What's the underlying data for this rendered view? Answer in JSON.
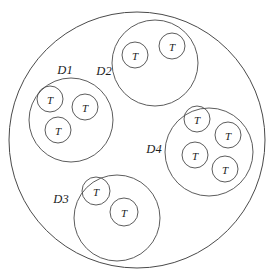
{
  "diagram": {
    "type": "nested-set-venn-diagram",
    "title": "",
    "background_color": "#ffffff",
    "stroke_color": "#4a4a4a",
    "text_color": "#1c1c1c",
    "canvas": {
      "width": 274,
      "height": 279
    },
    "universe": {
      "name": "outer-universe-circle",
      "label": "",
      "cx": 137,
      "cy": 140,
      "r": 128
    },
    "regions": [
      {
        "id": "D1",
        "label": "D1",
        "cx": 71,
        "cy": 120,
        "r": 42,
        "label_x": 65,
        "label_y": 70,
        "tuple_count": 3,
        "tuples": [
          {
            "label": "T",
            "cx": 50,
            "cy": 99,
            "r": 13
          },
          {
            "label": "T",
            "cx": 85,
            "cy": 107,
            "r": 13
          },
          {
            "label": "T",
            "cx": 58,
            "cy": 130,
            "r": 13
          }
        ]
      },
      {
        "id": "D2",
        "label": "D2",
        "cx": 155,
        "cy": 63,
        "r": 43,
        "label_x": 104,
        "label_y": 71,
        "tuple_count": 2,
        "tuples": [
          {
            "label": "T",
            "cx": 135,
            "cy": 55,
            "r": 13
          },
          {
            "label": "T",
            "cx": 172,
            "cy": 46,
            "r": 13
          }
        ]
      },
      {
        "id": "D3",
        "label": "D3",
        "cx": 117,
        "cy": 218,
        "r": 43,
        "label_x": 61,
        "label_y": 199,
        "tuple_count": 2,
        "tuples": [
          {
            "label": "T",
            "cx": 96,
            "cy": 191,
            "r": 14
          },
          {
            "label": "T",
            "cx": 124,
            "cy": 212,
            "r": 14
          }
        ]
      },
      {
        "id": "D4",
        "label": "D4",
        "cx": 209,
        "cy": 152,
        "r": 44,
        "label_x": 154,
        "label_y": 149,
        "tuple_count": 4,
        "tuples": [
          {
            "label": "T",
            "cx": 197,
            "cy": 119,
            "r": 13
          },
          {
            "label": "T",
            "cx": 228,
            "cy": 135,
            "r": 13
          },
          {
            "label": "T",
            "cx": 195,
            "cy": 155,
            "r": 13
          },
          {
            "label": "T",
            "cx": 225,
            "cy": 169,
            "r": 13
          }
        ]
      }
    ]
  }
}
